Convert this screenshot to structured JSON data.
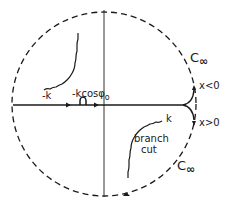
{
  "diagram": {
    "type": "complex-plane contour",
    "labels": {
      "minus_k": "-k",
      "pole": "-kcosφ",
      "pole_sub": "o",
      "plus_k": "k",
      "branch_cut_line1": "branch",
      "branch_cut_line2": "cut",
      "c_inf_upper": "C",
      "c_inf_upper_sub": "∞",
      "c_inf_lower": "C",
      "c_inf_lower_sub": "∞",
      "x_neg": "x<0",
      "x_pos": "x>0"
    },
    "colors": {
      "line": "#1a1a1a",
      "background": "#ffffff"
    }
  }
}
